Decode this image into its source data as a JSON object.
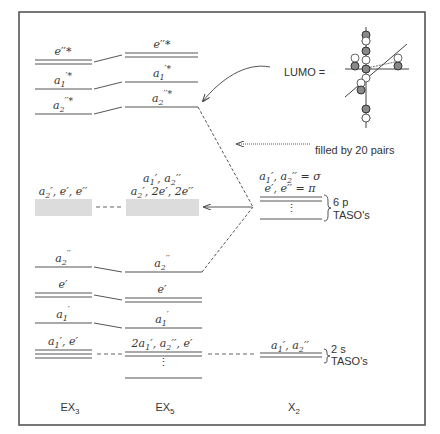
{
  "diagram": {
    "columns": {
      "ex3": {
        "base": "EX",
        "sub": "3"
      },
      "ex5": {
        "base": "EX",
        "sub": "5"
      },
      "x2": {
        "base": "X",
        "sub": "2"
      }
    },
    "ex3_levels": [
      {
        "label": "e''*",
        "degeneracy": 2
      },
      {
        "label": "a1'*",
        "degeneracy": 1
      },
      {
        "label": "a2''*",
        "degeneracy": 1
      },
      {
        "label": "a2', e', e''",
        "degeneracy": "band"
      },
      {
        "label": "a2''",
        "degeneracy": 1
      },
      {
        "label": "e'",
        "degeneracy": 2
      },
      {
        "label": "a1'",
        "degeneracy": 1
      },
      {
        "label": "a1', e'",
        "degeneracy": 3
      }
    ],
    "ex5_levels": [
      {
        "label": "e''*",
        "degeneracy": 2
      },
      {
        "label": "a1'*",
        "degeneracy": 1
      },
      {
        "label": "a2''*",
        "degeneracy": 1
      },
      {
        "label_line1": "a1', a2''",
        "label_line2": "a2', 2e', 2e''",
        "degeneracy": "band"
      },
      {
        "label": "a2''",
        "degeneracy": 1
      },
      {
        "label": "e'",
        "degeneracy": 2
      },
      {
        "label": "a1'",
        "degeneracy": 1
      },
      {
        "label": "2a1', a2'', e'",
        "degeneracy": "many"
      }
    ],
    "x2_levels": {
      "p_block": {
        "label_line1": "a1', a2'' = σ",
        "label_line2": "e', e'' = π",
        "brace_line1": "6 p",
        "brace_line2": "TASO's"
      },
      "s_block": {
        "label": "a1', a2''",
        "brace_line1": "2 s",
        "brace_line2": "TASO's"
      }
    },
    "annotations": {
      "lumo": "LUMO =",
      "filled": "filled by 20 pairs"
    }
  }
}
